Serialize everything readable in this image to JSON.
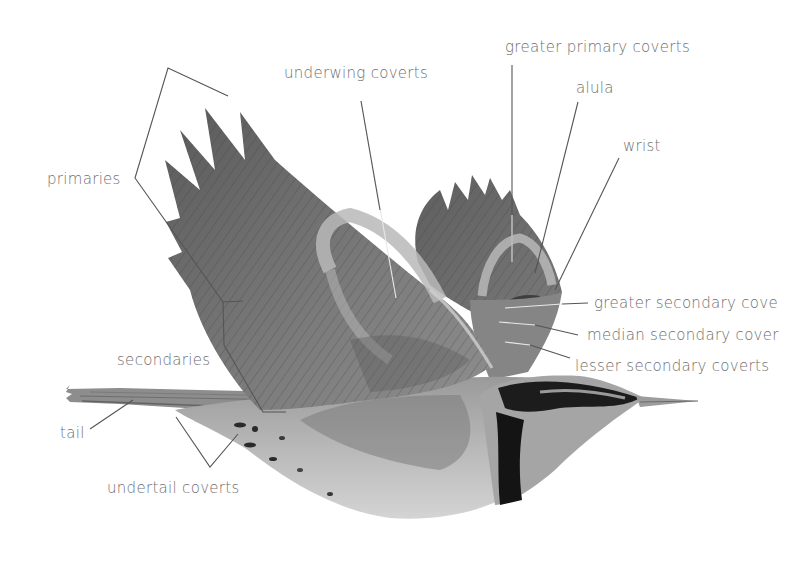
{
  "diagram": {
    "colors": {
      "background": "#ffffff",
      "label_text": "#6f6f6f",
      "leader_line": "#555555",
      "feather_dark": "#4a4a4a",
      "feather_mid": "#8a8a8a",
      "feather_light": "#c8c8c8",
      "collar_black": "#151515"
    },
    "labels": [
      {
        "id": "greater-primary-coverts",
        "text": "greater primary coverts"
      },
      {
        "id": "alula",
        "text": "alula"
      },
      {
        "id": "wrist",
        "text": "wrist"
      },
      {
        "id": "underwing-coverts",
        "text": "underwing coverts"
      },
      {
        "id": "primaries",
        "text": "primaries"
      },
      {
        "id": "greater-secondary-coverts",
        "text": "greater secondary cove"
      },
      {
        "id": "median-secondary-coverts",
        "text": "median secondary cover"
      },
      {
        "id": "lesser-secondary-coverts",
        "text": "lesser secondary coverts"
      },
      {
        "id": "secondaries",
        "text": "secondaries"
      },
      {
        "id": "tail",
        "text": "tail"
      },
      {
        "id": "undertail-coverts",
        "text": "undertail coverts"
      }
    ]
  }
}
